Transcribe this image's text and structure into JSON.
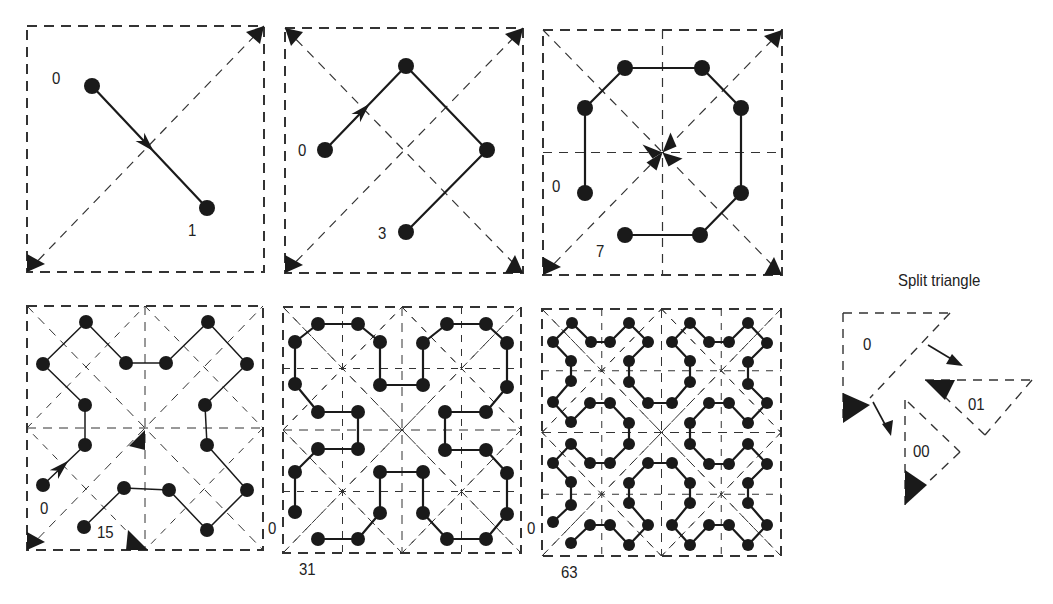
{
  "figure": {
    "colors": {
      "curve": "#1a1a1a",
      "dashed": "#333333",
      "background": "#ffffff"
    },
    "panels": [
      {
        "id": "order-1",
        "box": [
          27,
          26,
          264,
          272
        ],
        "start_label": "0",
        "end_label": "1",
        "start_label_pos": [
          52,
          70
        ],
        "end_label_pos": [
          188,
          222
        ],
        "points": [
          [
            92,
            86
          ],
          [
            207,
            208
          ]
        ],
        "arrow_segment": 0,
        "diagonals": [
          "main"
        ],
        "markers": [
          [
            264,
            26,
            "tr"
          ],
          [
            27,
            272,
            "bl"
          ]
        ]
      },
      {
        "id": "order-2",
        "box": [
          285,
          28,
          523,
          273
        ],
        "start_label": "0",
        "end_label": "3",
        "start_label_pos": [
          298,
          142
        ],
        "end_label_pos": [
          378,
          225
        ],
        "points": [
          [
            325,
            150
          ],
          [
            406,
            66
          ],
          [
            487,
            150
          ],
          [
            406,
            232
          ]
        ],
        "arrow_segment": 0,
        "diagonals": [
          "main",
          "anti"
        ],
        "markers": [
          [
            285,
            28,
            "tl"
          ],
          [
            523,
            28,
            "tr"
          ],
          [
            285,
            273,
            "bl"
          ],
          [
            523,
            273,
            "br"
          ]
        ]
      },
      {
        "id": "order-3",
        "box": [
          543,
          30,
          782,
          275
        ],
        "start_label": "0",
        "end_label": "7",
        "start_label_pos": [
          552,
          178
        ],
        "end_label_pos": [
          596,
          243
        ],
        "points": [
          [
            585,
            193
          ],
          [
            585,
            108
          ],
          [
            625,
            68
          ],
          [
            702,
            68
          ],
          [
            741,
            108
          ],
          [
            741,
            193
          ],
          [
            700,
            235
          ],
          [
            625,
            235
          ]
        ],
        "diagonals": [
          "main",
          "anti",
          "h",
          "v"
        ],
        "markers": [
          [
            782,
            30,
            "tr"
          ],
          [
            543,
            275,
            "bl"
          ],
          [
            782,
            275,
            "br"
          ]
        ],
        "center_markers": true
      },
      {
        "id": "order-4",
        "box": [
          27,
          306,
          263,
          550
        ],
        "start_label": "0",
        "end_label": "15",
        "start_label_pos": [
          40,
          500
        ],
        "end_label_pos": [
          97,
          524
        ],
        "points": [
          [
            43,
            485
          ],
          [
            85,
            445
          ],
          [
            85,
            405
          ],
          [
            43,
            364
          ],
          [
            86,
            322
          ],
          [
            126,
            363
          ],
          [
            166,
            363
          ],
          [
            208,
            322
          ],
          [
            247,
            364
          ],
          [
            205,
            405
          ],
          [
            207,
            445
          ],
          [
            247,
            490
          ],
          [
            207,
            530
          ],
          [
            169,
            490
          ],
          [
            124,
            488
          ],
          [
            84,
            527
          ]
        ],
        "arrow_segment": 0,
        "diagonals": [
          "main",
          "anti",
          "h",
          "v",
          "sub"
        ],
        "markers": [
          [
            27,
            550,
            "bl"
          ],
          [
            130,
            550,
            "mid"
          ]
        ]
      },
      {
        "id": "order-5",
        "box": [
          283,
          307,
          521,
          553
        ],
        "start_label": "0",
        "end_label": "31",
        "start_label_pos": [
          268,
          520
        ],
        "end_label_pos": [
          299,
          560
        ],
        "points": [
          [
            295,
            512
          ],
          [
            295,
            472
          ],
          [
            318,
            449
          ],
          [
            358,
            449
          ],
          [
            358,
            412
          ],
          [
            318,
            412
          ],
          [
            295,
            384
          ],
          [
            295,
            342
          ],
          [
            318,
            324
          ],
          [
            358,
            324
          ],
          [
            380,
            342
          ],
          [
            380,
            385
          ],
          [
            423,
            385
          ],
          [
            423,
            343
          ],
          [
            447,
            324
          ],
          [
            486,
            324
          ],
          [
            507,
            343
          ],
          [
            507,
            387
          ],
          [
            486,
            412
          ],
          [
            445,
            412
          ],
          [
            445,
            450
          ],
          [
            486,
            450
          ],
          [
            507,
            473
          ],
          [
            507,
            514
          ],
          [
            486,
            539
          ],
          [
            447,
            539
          ],
          [
            423,
            513
          ],
          [
            423,
            472
          ],
          [
            380,
            472
          ],
          [
            380,
            513
          ],
          [
            358,
            539
          ],
          [
            318,
            539
          ]
        ],
        "diagonals": [
          "main",
          "anti",
          "h",
          "v",
          "sub",
          "sub2"
        ],
        "markers": []
      },
      {
        "id": "order-6",
        "box": [
          542,
          309,
          781,
          556
        ],
        "start_label": "0",
        "end_label": "63",
        "start_label_pos": [
          527,
          520
        ],
        "end_label_pos": [
          561,
          563
        ],
        "points": [
          [
            553,
            522
          ],
          [
            571,
            505
          ],
          [
            571,
            482
          ],
          [
            553,
            463
          ],
          [
            571,
            444
          ],
          [
            590,
            463
          ],
          [
            610,
            463
          ],
          [
            629,
            444
          ],
          [
            629,
            423
          ],
          [
            610,
            403
          ],
          [
            590,
            403
          ],
          [
            571,
            422
          ],
          [
            553,
            402
          ],
          [
            571,
            381
          ],
          [
            571,
            361
          ],
          [
            553,
            342
          ],
          [
            572,
            323
          ],
          [
            591,
            342
          ],
          [
            610,
            342
          ],
          [
            629,
            323
          ],
          [
            648,
            342
          ],
          [
            629,
            361
          ],
          [
            629,
            382
          ],
          [
            648,
            403
          ],
          [
            672,
            403
          ],
          [
            690,
            382
          ],
          [
            690,
            361
          ],
          [
            672,
            342
          ],
          [
            690,
            323
          ],
          [
            709,
            342
          ],
          [
            729,
            342
          ],
          [
            748,
            323
          ],
          [
            767,
            343
          ],
          [
            748,
            362
          ],
          [
            748,
            384
          ],
          [
            767,
            403
          ],
          [
            748,
            423
          ],
          [
            729,
            403
          ],
          [
            709,
            403
          ],
          [
            690,
            423
          ],
          [
            690,
            444
          ],
          [
            709,
            464
          ],
          [
            729,
            464
          ],
          [
            748,
            444
          ],
          [
            767,
            464
          ],
          [
            748,
            483
          ],
          [
            748,
            503
          ],
          [
            767,
            525
          ],
          [
            748,
            545
          ],
          [
            729,
            525
          ],
          [
            709,
            525
          ],
          [
            690,
            545
          ],
          [
            672,
            525
          ],
          [
            690,
            503
          ],
          [
            690,
            483
          ],
          [
            672,
            463
          ],
          [
            648,
            463
          ],
          [
            629,
            483
          ],
          [
            629,
            503
          ],
          [
            648,
            525
          ],
          [
            629,
            545
          ],
          [
            610,
            525
          ],
          [
            590,
            525
          ],
          [
            571,
            543
          ]
        ],
        "diagonals": [
          "main",
          "anti",
          "h",
          "v",
          "sub",
          "sub2"
        ],
        "markers": []
      }
    ],
    "split_triangle": {
      "title": "Split triangle",
      "title_pos": [
        898,
        271
      ],
      "labels": [
        {
          "text": "0",
          "pos": [
            863,
            336
          ]
        },
        {
          "text": "01",
          "pos": [
            968,
            396
          ]
        },
        {
          "text": "00",
          "pos": [
            913,
            443
          ]
        }
      ]
    }
  }
}
